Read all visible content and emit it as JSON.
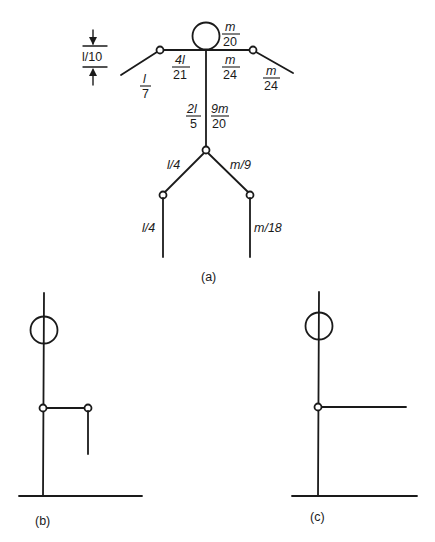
{
  "figure_a": {
    "caption": "(a)",
    "dimension_label": "l/10",
    "head_mass": {
      "num": "m",
      "den": "20"
    },
    "upper_arm_left_length": {
      "num": "4l",
      "den": "21"
    },
    "forearm_left_length": {
      "num": "l",
      "den": "7"
    },
    "upper_arm_right_mass": {
      "num": "m",
      "den": "24"
    },
    "forearm_right_mass": {
      "num": "m",
      "den": "24"
    },
    "torso_length": {
      "num": "2l",
      "den": "5"
    },
    "torso_mass": {
      "num": "9m",
      "den": "20"
    },
    "thigh_length": "l/4",
    "thigh_mass": "m/9",
    "shank_length": "l/4",
    "shank_mass": "m/18"
  },
  "figure_b": {
    "caption": "(b)"
  },
  "figure_c": {
    "caption": "(c)"
  },
  "colors": {
    "stroke": "#1a1a1a",
    "background": "#ffffff"
  }
}
